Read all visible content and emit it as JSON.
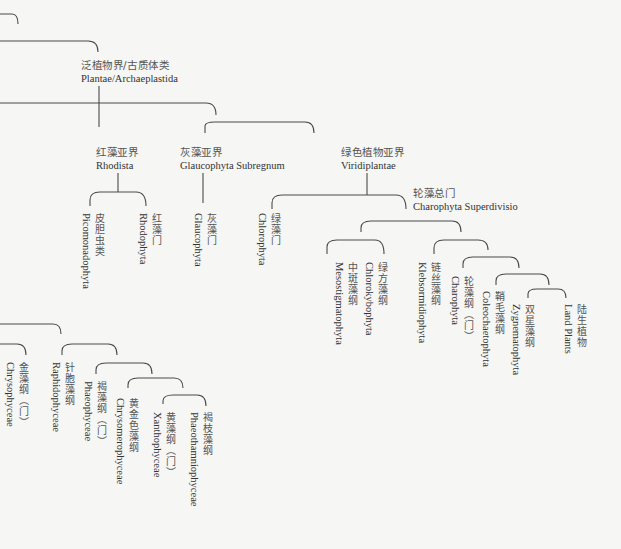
{
  "colors": {
    "background": "#f6f6f4",
    "line": "#4a4a4a",
    "text": "#3a3a3a"
  },
  "diagram": {
    "horizontal_labels": [
      {
        "id": "plantae",
        "zh": "泛植物界/古质体类",
        "la": "Plantae/Archaeplastida",
        "x": 81,
        "y": 59
      },
      {
        "id": "rhodista",
        "zh": "红藻亚界",
        "la": "Rhodista",
        "x": 96,
        "y": 146
      },
      {
        "id": "glaucophyta-subregnum",
        "zh": "灰藻亚界",
        "la": "Glaucophyta Subregnum",
        "x": 180,
        "y": 146
      },
      {
        "id": "viridiplantae",
        "zh": "绿色植物亚界",
        "la": "Viridiplantae",
        "x": 341,
        "y": 146
      },
      {
        "id": "charophyta-superdivisio",
        "zh": "轮藻总门",
        "la": "Charophyta Superdivisio",
        "x": 413,
        "y": 190
      }
    ],
    "vertical_labels": [
      {
        "id": "picomonadophyta",
        "zh": "皮胆虫类",
        "la": "Picomonadophyta",
        "x": 84,
        "y": 213
      },
      {
        "id": "rhodophyta",
        "zh": "红藻门",
        "la": "Rhodophyta",
        "x": 140,
        "y": 213
      },
      {
        "id": "glaucophyta",
        "zh": "灰藻门",
        "la": "Glaucophyta",
        "x": 192,
        "y": 213
      },
      {
        "id": "chlorophyta",
        "zh": "绿藻门",
        "la": "Chlorophyta",
        "x": 257,
        "y": 213
      },
      {
        "id": "mesostigmatophyta",
        "zh": "中斑藻纲",
        "la": "Mesostigmatophyta",
        "x": 334,
        "y": 262
      },
      {
        "id": "chlorokybophyta",
        "zh": "绿方藻纲",
        "la": "Chlorokybophyta",
        "x": 364,
        "y": 262
      },
      {
        "id": "klebsormidiophyta",
        "zh": "链丝藻纲",
        "la": "Klebsormidiophyta",
        "x": 417,
        "y": 262
      },
      {
        "id": "charophyta",
        "zh": "轮藻纲（门）",
        "la": "Charophyta",
        "x": 460,
        "y": 276
      },
      {
        "id": "coleochaetophyta",
        "zh": "鞘毛藻纲",
        "la": "Coleochaetophyta",
        "x": 480,
        "y": 291
      },
      {
        "id": "zygnematophyta",
        "zh": "双星藻纲",
        "la": "Zygnematophyta",
        "x": 510,
        "y": 304
      },
      {
        "id": "land-plants",
        "zh": "陆生植物",
        "la": "Land Plants",
        "x": 563,
        "y": 304
      },
      {
        "id": "chrysophyceae",
        "zh": "金藻纲（门）",
        "la": "Chrysophyceae",
        "x": 5,
        "y": 362
      },
      {
        "id": "raphidophyceae",
        "zh": "针胞藻纲",
        "la": "Raphidophyceae",
        "x": 50,
        "y": 362
      },
      {
        "id": "phaeophyceae",
        "zh": "褐藻纲（门）",
        "la": "Phaeophyceae",
        "x": 83,
        "y": 380
      },
      {
        "id": "chrysomerophyceae",
        "zh": "黄金色藻纲",
        "la": "Chrysomerophyceae",
        "x": 115,
        "y": 398
      },
      {
        "id": "xanthophyceae",
        "zh": "黄藻纲（门）",
        "la": "Xanthophyceae",
        "x": 150,
        "y": 412
      },
      {
        "id": "phaeothamniophyceae",
        "zh": "褐枝藻纲",
        "la": "Phaeothamniophyceae",
        "x": 188,
        "y": 412
      }
    ]
  }
}
